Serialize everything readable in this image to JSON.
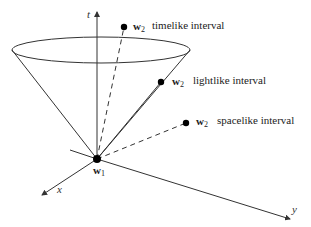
{
  "diagram": {
    "type": "light-cone",
    "axes": {
      "t": {
        "label": "t"
      },
      "x": {
        "label": "x"
      },
      "y": {
        "label": "y"
      }
    },
    "origin_event": {
      "symbol": "w",
      "subscript": "1"
    },
    "events": [
      {
        "symbol": "w",
        "subscript": "2",
        "label": "timelike interval",
        "connector": "dashed"
      },
      {
        "symbol": "w",
        "subscript": "2",
        "label": "lightlike interval",
        "connector": "solid"
      },
      {
        "symbol": "w",
        "subscript": "2",
        "label": "spacelike interval",
        "connector": "dashed"
      }
    ],
    "colors": {
      "line": "#333333",
      "dot": "#000000",
      "background": "#ffffff"
    }
  }
}
